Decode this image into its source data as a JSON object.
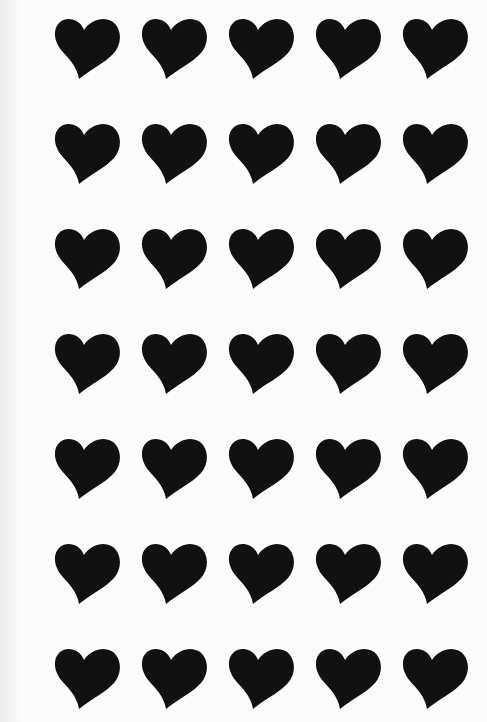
{
  "sheet": {
    "background": "#fbfbfb",
    "heart_color": "#111111",
    "rows": 7,
    "columns": 5,
    "icon": "heart-icon"
  }
}
